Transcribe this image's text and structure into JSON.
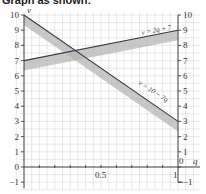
{
  "title": "Graph as shown:",
  "chart_data": {
    "type": "line",
    "title": "Graph as shown:",
    "xlabel": "q",
    "ylabel": "v",
    "xlim": [
      0,
      1
    ],
    "ylim": [
      -1,
      10
    ],
    "grid": true,
    "x_ticks": [
      "0.5",
      "1"
    ],
    "y_ticks_left": [
      "10",
      "9",
      "8",
      "7",
      "6",
      "5",
      "4",
      "3",
      "2",
      "1",
      "0",
      "-1"
    ],
    "y_ticks_right": [
      "10",
      "9",
      "8",
      "7",
      "6",
      "5",
      "4",
      "3",
      "2",
      "1",
      "0",
      "-1"
    ],
    "series": [
      {
        "name": "v = 2q + 7",
        "x": [
          0,
          1
        ],
        "y": [
          7,
          9
        ],
        "shaded_below": true
      },
      {
        "name": "v = 10 - 7q",
        "x": [
          0,
          1
        ],
        "y": [
          10,
          3
        ],
        "shaded_below": true
      }
    ],
    "annotations": [
      "v = 2q + 7",
      "v = 10 − 7q"
    ]
  },
  "labels": {
    "line1": "v = 2q + 7",
    "line2": "v = 10 − 7q",
    "x_axis": "q",
    "y_axis": "v",
    "x_half": "0.5",
    "x_one": "1",
    "origin_right": "0"
  }
}
